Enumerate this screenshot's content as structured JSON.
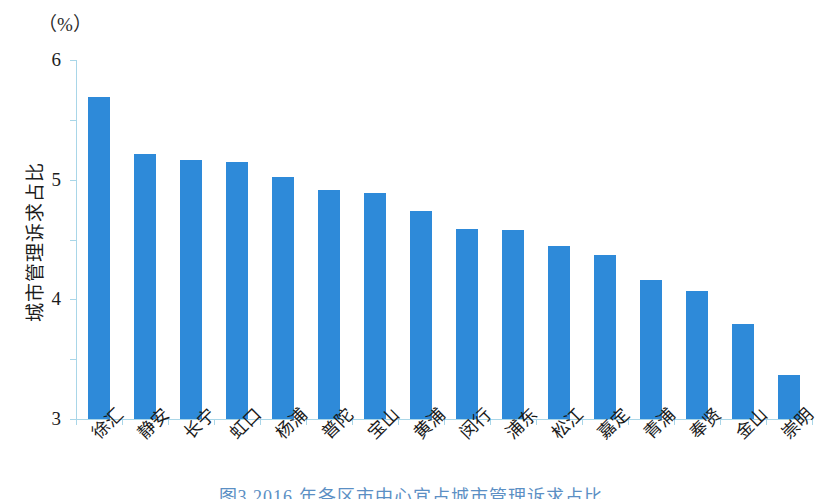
{
  "figure": {
    "unit_label": "（%）",
    "caption": "图3  2016 年各区市中心宜占城市管理诉求占比"
  },
  "chart_data": {
    "type": "bar",
    "title": "",
    "xlabel": "",
    "ylabel": "城市管理诉求占比",
    "unit": "%",
    "ylim": [
      0,
      6
    ],
    "yticks": [
      0,
      1,
      2,
      3,
      4,
      5,
      6
    ],
    "ytick_labels": [
      "0",
      "1",
      "2",
      "3",
      "4",
      "5",
      "6"
    ],
    "grid": false,
    "legend": false,
    "bar_color": "#2e8ad9",
    "axis_color": "#a9d6e8",
    "categories": [
      "徐汇",
      "静安",
      "长宁",
      "虹口",
      "杨浦",
      "普陀",
      "宝山",
      "黄浦",
      "闵行",
      "浦东",
      "松江",
      "嘉定",
      "青浦",
      "奉贤",
      "金山",
      "崇明"
    ],
    "values": [
      5.38,
      4.43,
      4.33,
      4.3,
      4.05,
      3.82,
      3.77,
      3.47,
      3.18,
      3.16,
      2.89,
      2.74,
      2.32,
      2.14,
      1.58,
      0.74
    ]
  }
}
